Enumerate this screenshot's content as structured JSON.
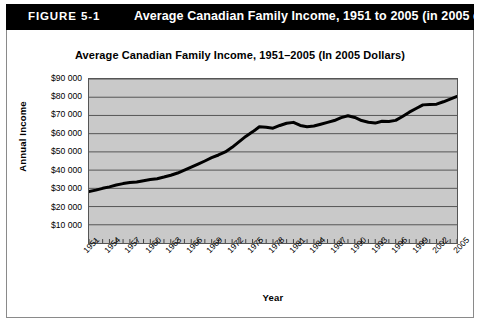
{
  "header": {
    "figure_number": "FIGURE 5-1",
    "title": "Average Canadian Family Income, 1951 to 2005 (in 2005 dollars)"
  },
  "chart_data": {
    "type": "line",
    "title": "Average Canadian Family Income, 1951–2005 (In 2005 Dollars)",
    "xlabel": "Year",
    "ylabel": "Annual Income",
    "xlim": [
      1951,
      2005
    ],
    "ylim": [
      0,
      90000
    ],
    "grid": true,
    "legend": null,
    "y_ticks": [
      90000,
      80000,
      70000,
      60000,
      50000,
      40000,
      30000,
      20000,
      10000
    ],
    "y_tick_labels": [
      "$90 000",
      "$80 000",
      "$70 000",
      "$60 000",
      "$50 000",
      "$40 000",
      "$30 000",
      "$20 000",
      "$10 000"
    ],
    "x_tick_labels": [
      "1951",
      "1954",
      "1957",
      "1960",
      "1963",
      "1966",
      "1969",
      "1972",
      "1975",
      "1978",
      "1981",
      "1984",
      "1987",
      "1990",
      "1993",
      "1996",
      "1999",
      "2002",
      "2005"
    ],
    "series": [
      {
        "name": "Average Canadian Family Income",
        "color": "#000000",
        "x": [
          1951,
          1952,
          1953,
          1954,
          1955,
          1956,
          1957,
          1958,
          1959,
          1960,
          1961,
          1962,
          1963,
          1964,
          1965,
          1966,
          1967,
          1968,
          1969,
          1970,
          1971,
          1972,
          1973,
          1974,
          1975,
          1976,
          1977,
          1978,
          1979,
          1980,
          1981,
          1982,
          1983,
          1984,
          1985,
          1986,
          1987,
          1988,
          1989,
          1990,
          1991,
          1992,
          1993,
          1994,
          1995,
          1996,
          1997,
          1998,
          1999,
          2000,
          2001,
          2002,
          2003,
          2004,
          2005
        ],
        "y": [
          28200,
          29000,
          30000,
          30800,
          31800,
          32600,
          33200,
          33500,
          34200,
          34800,
          35300,
          36200,
          37200,
          38400,
          40000,
          41600,
          43300,
          45000,
          46800,
          48300,
          50000,
          52500,
          55500,
          58500,
          61000,
          63800,
          63500,
          63000,
          64500,
          65700,
          66200,
          64500,
          63800,
          64200,
          65200,
          66200,
          67200,
          68800,
          69800,
          68900,
          67200,
          66300,
          65800,
          66800,
          66700,
          67300,
          69400,
          71800,
          73800,
          75800,
          76000,
          76200,
          77500,
          79000,
          80400
        ]
      }
    ]
  }
}
